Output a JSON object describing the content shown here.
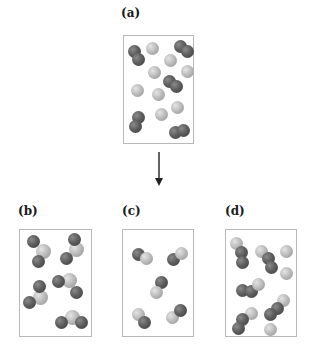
{
  "labels": {
    "a": "(a)",
    "b": "(b)",
    "c": "(c)",
    "d": "(d)"
  },
  "atom_colors": {
    "dark": "#5e5e5e",
    "light": "#bdbdbd"
  },
  "panels": {
    "a": {
      "description": "Reactant mixture: dark diatomic molecules and single light atoms",
      "dark_diatomic_molecules": 5,
      "light_single_atoms": 8
    },
    "b": {
      "description": "Triatomic molecules: one light atom bonded to two dark atoms",
      "molecules": 5,
      "molecule_type": "dark-light-dark"
    },
    "c": {
      "description": "Diatomic molecules: one dark atom bonded to one light atom",
      "molecules": 5,
      "molecule_type": "dark-light"
    },
    "d": {
      "description": "Mixture of triatomic light-dark-dark molecules plus leftover light atoms",
      "molecules": 5,
      "molecule_type": "light-dark-dark",
      "single_light_atoms": 3
    }
  },
  "arrow": {
    "direction": "down"
  }
}
